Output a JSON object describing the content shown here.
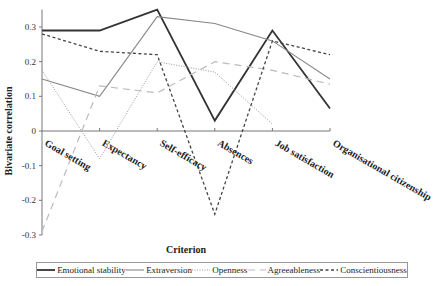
{
  "chart_data": {
    "type": "line",
    "title": "",
    "xlabel": "Criterion",
    "ylabel": "Bivariate correlation",
    "ylim": [
      -0.3,
      0.35
    ],
    "yticks": [
      0.3,
      0.2,
      0.1,
      0,
      -0.1,
      -0.2,
      -0.3
    ],
    "ytick_labels": [
      "0.3",
      "0.2",
      "0.1",
      "0",
      "-0.1",
      "-0.2",
      "-0.3"
    ],
    "grid": false,
    "legend_position": "bottom",
    "categories": [
      "Goal setting",
      "Expectancy",
      "Self-efficacy",
      "Absences",
      "Job satisfaction",
      "Organisational citizenship"
    ],
    "series": [
      {
        "name": "Emotional stability",
        "values": [
          0.29,
          0.29,
          0.35,
          0.03,
          0.29,
          0.065
        ],
        "color": "#333333",
        "width": 1.8,
        "dash": ""
      },
      {
        "name": "Extraversion",
        "values": [
          0.15,
          0.1,
          0.33,
          0.31,
          0.26,
          0.15
        ],
        "color": "#888888",
        "width": 1.1,
        "dash": ""
      },
      {
        "name": "Openness",
        "values": [
          0.175,
          -0.08,
          0.2,
          0.17,
          0.02,
          null
        ],
        "color": "#999999",
        "width": 1,
        "dash": "1,1.5"
      },
      {
        "name": "Agreeableness",
        "values": [
          -0.29,
          0.13,
          0.11,
          0.2,
          0.175,
          0.135
        ],
        "color": "#bbbbbb",
        "width": 1.2,
        "dash": "7,5"
      },
      {
        "name": "Conscientiousness",
        "values": [
          0.28,
          0.23,
          0.22,
          -0.24,
          0.26,
          0.22
        ],
        "color": "#444444",
        "width": 1.3,
        "dash": "3,2.5"
      }
    ]
  }
}
